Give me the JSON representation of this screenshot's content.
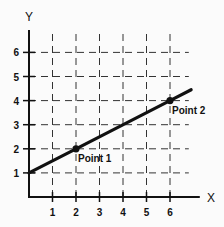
{
  "chart_data": {
    "type": "line",
    "title": "",
    "xlabel": "X",
    "ylabel": "Y",
    "xlim": [
      0,
      6.8
    ],
    "ylim": [
      0,
      6.8
    ],
    "x_ticks": [
      1,
      2,
      3,
      4,
      5,
      6
    ],
    "y_ticks": [
      1,
      2,
      3,
      4,
      5,
      6
    ],
    "grid": true,
    "grid_style": "dashed",
    "series": [
      {
        "name": "line",
        "x": [
          0,
          2,
          6,
          6.9
        ],
        "y": [
          1,
          2,
          4,
          4.45
        ],
        "color": "#111111"
      }
    ],
    "points": [
      {
        "label": "Point 1",
        "x": 2,
        "y": 2
      },
      {
        "label": "Point 2",
        "x": 6,
        "y": 4
      }
    ],
    "legend": null
  },
  "axes": {
    "x_title": "X",
    "y_title": "Y",
    "x_tick_labels": [
      "1",
      "2",
      "3",
      "4",
      "5",
      "6"
    ],
    "y_tick_labels": [
      "1",
      "2",
      "3",
      "4",
      "5",
      "6"
    ]
  },
  "annotations": {
    "point1": "Point 1",
    "point2": "Point 2"
  },
  "colors": {
    "ink": "#111111",
    "grid": "#333333",
    "background": "#fbfbfb"
  }
}
